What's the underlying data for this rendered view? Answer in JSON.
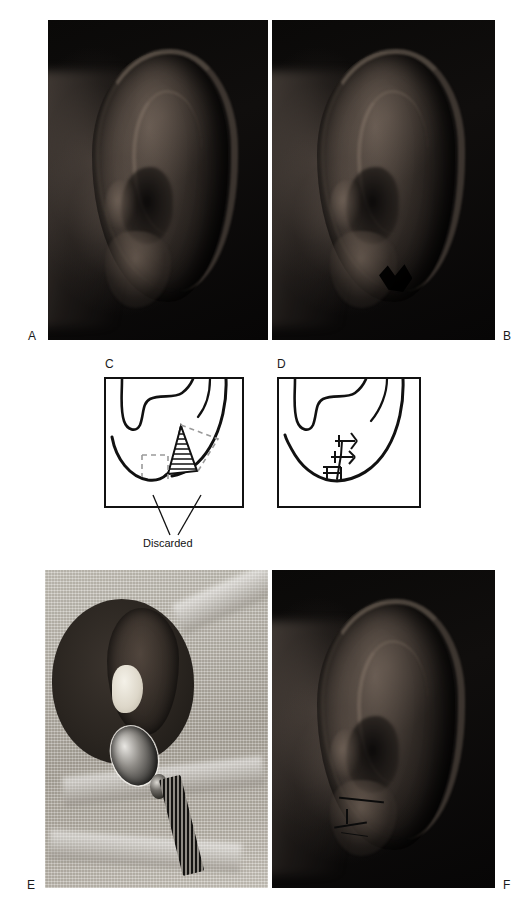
{
  "figure": {
    "type": "surgical-technique-figure",
    "background_color": "#ffffff",
    "panel_letter_color": "#1a1a1a"
  },
  "panels": [
    {
      "id": "A",
      "letter": "A",
      "kind": "photograph",
      "name": "panel-a-preoperative-ear-photo",
      "content": "Preoperative lateral photograph of a normal ear on black background"
    },
    {
      "id": "B",
      "letter": "B",
      "kind": "photograph",
      "name": "panel-b-cleft-lobule-photo",
      "content": "Lateral photograph of the ear showing a cleft earlobe defect"
    },
    {
      "id": "C",
      "letter": "C",
      "kind": "line-diagram",
      "name": "panel-c-excision-design",
      "content": "Line drawing of the cleft lobule with the planned wedge excision outlined and hatched",
      "annotation": "Discarded",
      "annotation_leader_count": 2
    },
    {
      "id": "D",
      "letter": "D",
      "kind": "line-diagram",
      "name": "panel-d-closure-sutures",
      "content": "Line drawing of the repaired lobule closed with three interrupted sutures",
      "suture_count": 3
    },
    {
      "id": "E",
      "letter": "E",
      "kind": "photograph",
      "name": "panel-e-intraoperative-photo",
      "content": "Intraoperative photograph: draped head on gauze field with ear packing and a surgical instrument"
    },
    {
      "id": "F",
      "letter": "F",
      "kind": "photograph",
      "name": "panel-f-postoperative-photo",
      "content": "Postoperative photograph of the ear with the sutured lobule"
    }
  ],
  "labels": {
    "discarded": "Discarded"
  }
}
